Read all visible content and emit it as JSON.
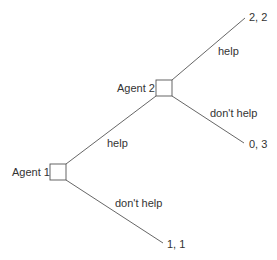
{
  "diagram": {
    "type": "extensive-form game tree",
    "nodes": [
      {
        "id": "agent1",
        "label": "Agent 1"
      },
      {
        "id": "agent2",
        "label": "Agent 2"
      }
    ],
    "edges": [
      {
        "from": "agent1",
        "to": "agent2",
        "label": "help"
      },
      {
        "from": "agent1",
        "to": "payoff_1_1",
        "label": "don't help"
      },
      {
        "from": "agent2",
        "to": "payoff_2_2",
        "label": "help"
      },
      {
        "from": "agent2",
        "to": "payoff_0_3",
        "label": "don't help"
      }
    ],
    "payoffs": {
      "payoff_2_2": "2, 2",
      "payoff_0_3": "0, 3",
      "payoff_1_1": "1, 1"
    }
  }
}
